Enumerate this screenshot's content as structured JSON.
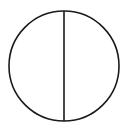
{
  "diagram": {
    "kind": "circle-bisected-by-diameter",
    "background": "#ffffff",
    "stroke_color": "#1a1a1a",
    "stroke_width": 1.6,
    "circle": {
      "cx": 64,
      "cy": 66,
      "r": 55
    },
    "diameter": {
      "x1": 64,
      "y1": 11,
      "x2": 64,
      "y2": 121,
      "orientation": "vertical"
    },
    "labels": []
  }
}
